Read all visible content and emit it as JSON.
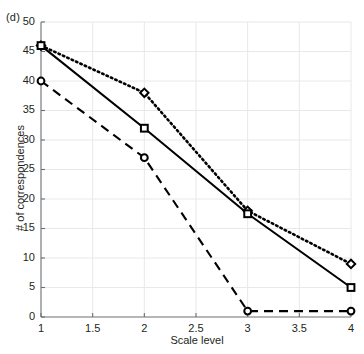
{
  "figure": {
    "panel_label": "(d)",
    "background_color": "#ffffff",
    "axis_color": "#6d6e71",
    "grid_color": "#e8e8ea",
    "text_color": "#231f20",
    "series_color": "#000000"
  },
  "chart_data": {
    "type": "line",
    "title": "",
    "subtitle": "",
    "xlabel": "Scale level",
    "ylabel": "# of correspondences",
    "x": [
      1,
      2,
      3,
      4
    ],
    "xlim": [
      1,
      4
    ],
    "ylim": [
      0,
      50
    ],
    "xticks": [
      1,
      1.5,
      2,
      2.5,
      3,
      3.5,
      4
    ],
    "xticklabels": [
      "1",
      "1.5",
      "2",
      "2.5",
      "3",
      "3.5",
      "4"
    ],
    "yticks": [
      0,
      5,
      10,
      15,
      20,
      25,
      30,
      35,
      40,
      45,
      50
    ],
    "yticklabels": [
      "0",
      "5",
      "10",
      "15",
      "20",
      "25",
      "30",
      "35",
      "40",
      "45",
      "50"
    ],
    "grid": true,
    "legend": false,
    "legend_position": "none",
    "annotations": [
      "(d)"
    ],
    "series": [
      {
        "name": "dotted-diamond",
        "linestyle": "dotted",
        "marker": "diamond",
        "color": "#000000",
        "values": [
          46,
          38,
          18,
          9
        ]
      },
      {
        "name": "solid-square",
        "linestyle": "solid",
        "marker": "square",
        "color": "#000000",
        "values": [
          46,
          32,
          17.5,
          5
        ]
      },
      {
        "name": "dashed-circle",
        "linestyle": "dashed",
        "marker": "circle",
        "color": "#000000",
        "values": [
          40,
          27,
          1,
          1
        ]
      }
    ]
  }
}
